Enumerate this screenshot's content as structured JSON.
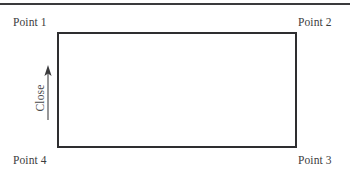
{
  "figure": {
    "width": 350,
    "height": 174,
    "background_color": "#ffffff",
    "line_color": "#2e2e30",
    "text_color": "#3c3c3e"
  },
  "top_rule": {
    "name": "horizontal-divider"
  },
  "labels": {
    "point_1": "Point 1",
    "point_2": "Point 2",
    "point_3": "Point 3",
    "point_4": "Point 4"
  },
  "axis": {
    "close_label": "Close",
    "arrow_direction": "up"
  },
  "rectangle": {
    "description": "open rectangle outline connecting Point 1, Point 2, Point 3, Point 4"
  }
}
